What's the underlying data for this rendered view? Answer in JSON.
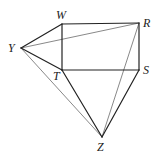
{
  "diagram": {
    "type": "geometric-figure",
    "points": {
      "W": {
        "label": "W",
        "x": 62,
        "y": 24,
        "lx": 56,
        "ly": 19
      },
      "R": {
        "label": "R",
        "x": 139,
        "y": 23,
        "lx": 143,
        "ly": 27
      },
      "Y": {
        "label": "Y",
        "x": 21,
        "y": 48,
        "lx": 8,
        "ly": 52
      },
      "T": {
        "label": "T",
        "x": 62,
        "y": 70,
        "lx": 53,
        "ly": 80
      },
      "S": {
        "label": "S",
        "x": 139,
        "y": 70,
        "lx": 143,
        "ly": 74
      },
      "Z": {
        "label": "Z",
        "x": 102,
        "y": 137,
        "lx": 97,
        "ly": 151
      }
    },
    "thick_edges": [
      [
        "W",
        "R"
      ],
      [
        "W",
        "T"
      ],
      [
        "R",
        "S"
      ],
      [
        "T",
        "S"
      ],
      [
        "Y",
        "W"
      ],
      [
        "Y",
        "T"
      ],
      [
        "T",
        "Z"
      ],
      [
        "S",
        "Z"
      ]
    ],
    "thin_edges": [
      [
        "Y",
        "R"
      ],
      [
        "Y",
        "Z"
      ],
      [
        "R",
        "Z"
      ]
    ],
    "colors": {
      "thick": "#222222",
      "thin": "#555555"
    }
  }
}
